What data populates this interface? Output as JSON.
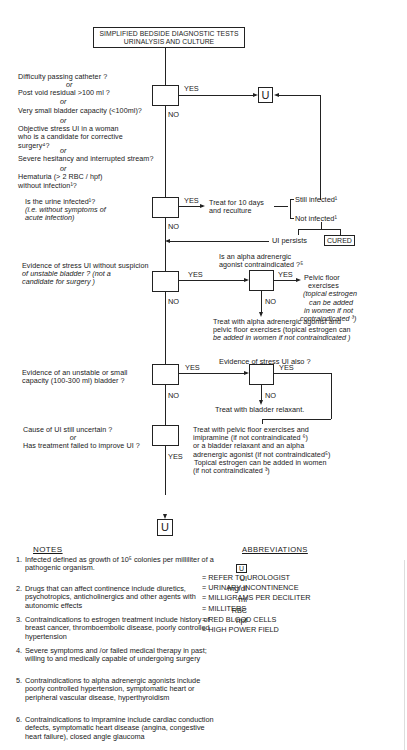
{
  "title": {
    "line1": "SIMPLIFIED BEDSIDE DIAGNOSTIC TESTS",
    "line2": "URINALYSIS AND CULTURE"
  },
  "decision1": {
    "questions": [
      "Difficulty passing catheter ?",
      "or",
      "Post void residual >100 ml ?",
      "or",
      "Very small bladder capacity (<100ml)?",
      "or",
      "Objective stress UI in a woman",
      "who is a candidate for corrective",
      "surgery⁴?",
      "or",
      "Severe hesitancy and interrupted stream?",
      "or",
      "Hematuria (> 2 RBC / hpf)",
      "without infection¹?"
    ],
    "yes_label": "YES",
    "no_label": "NO",
    "yes_target": "U"
  },
  "decision2": {
    "question_line1": "Is the urine infected¹?",
    "question_line2": "(i.e. without symptoms of",
    "question_line3": "acute infection)",
    "yes_label": "YES",
    "no_label": "NO",
    "treat_line1": "Treat for 10 days",
    "treat_line2": "and reculture",
    "still_infected": "Still infected¹",
    "not_infected": "Not infected¹",
    "ui_persists": "UI persists",
    "cured": "CURED"
  },
  "decision3": {
    "question_line1": "Evidence of stress UI without suspicion",
    "question_line2": "of unstable bladder ? (not a",
    "question_line3": "candidate for surgery )",
    "yes_label": "YES",
    "no_label": "NO",
    "sub_question_line1": "Is an alpha adrenergic",
    "sub_question_line2": "agonist contraindicated ?⁵",
    "sub_yes_label": "YES",
    "sub_no_label": "NO",
    "pelvic_line1": "Pelvic floor",
    "pelvic_line2": "exercises",
    "pelvic_line3": "(topical estrogen",
    "pelvic_line4": "can be added",
    "pelvic_line5": "in women if not",
    "pelvic_line6": "contraindicated ³)",
    "alpha_treat_line1": "Treat with alpha adrenergic agonist and",
    "alpha_treat_line2": "pelvic floor exercises (topical estrogen can",
    "alpha_treat_line3": "be added in women if not contraindicated )"
  },
  "decision4": {
    "question_line1": "Evidence of an unstable or small",
    "question_line2": "capacity (100-300 ml) bladder ?",
    "yes_label": "YES",
    "no_label": "NO",
    "sub_question": "Evidence of stress UI also ?",
    "sub_yes_label": "YES",
    "sub_no_label": "NO",
    "relaxant": "Treat with bladder relaxant."
  },
  "decision5": {
    "question_line1": "Cause of UI still uncertain ?",
    "question_line2": "or",
    "question_line3": "Has treatment failed to improve UI ?",
    "yes_label": "YES",
    "combined_line1": "Treat with pelvic floor exercises and",
    "combined_line2": "imipramine (if not contraindicated ⁶)",
    "combined_line3": "or a bladder relaxant and an alpha",
    "combined_line4": "adrenergic agonist (if not contraindicated⁵)",
    "combined_line5": "Topical estrogen can be added in women",
    "combined_line6": "(if not contraindicated ³)",
    "yes_target": "U"
  },
  "notes": {
    "title": "NOTES",
    "items": [
      {
        "num": "1.",
        "text": "Infected defined as growth of 10⁵ colonies per milliliter of a pathogenic organism."
      },
      {
        "num": "2.",
        "text": "Drugs that can affect continence include diuretics, psychotropics, anticholinergics and other agents with autonomic effects"
      },
      {
        "num": "3.",
        "text": "Contraindications to estrogen treatment include history of breast cancer, thromboembolic disease, poorly controlled hypertension"
      },
      {
        "num": "4.",
        "text": "Severe symptoms and /or failed medical therapy in past; willing to and medically capable of undergoing surgery"
      },
      {
        "num": "5.",
        "text": "Contraindications to alpha adrenergic agonists include poorly controlled hypertension, symptomatic heart or peripheral vascular disease, hyperthyroidism"
      },
      {
        "num": "6.",
        "text": "Contraindications to impramine include cardiac conduction defects, symptomatic heart disease (angina, congestive heart failure), closed angle glaucoma"
      }
    ]
  },
  "abbreviations": {
    "title": "ABBREVIATIONS",
    "items": [
      {
        "key": "U",
        "value": "= REFER TO UROLOGIST"
      },
      {
        "key": "UI",
        "value": "= URINARY INCONTINENCE"
      },
      {
        "key": "mg/dl",
        "value": "= MILLIGRAMS PER DECILITER"
      },
      {
        "key": "ml",
        "value": "= MILLITERS"
      },
      {
        "key": "RBC",
        "value": "= RED BLOOD CELLS"
      },
      {
        "key": "hpf",
        "value": "= HIGH POWER FIELD"
      }
    ]
  }
}
